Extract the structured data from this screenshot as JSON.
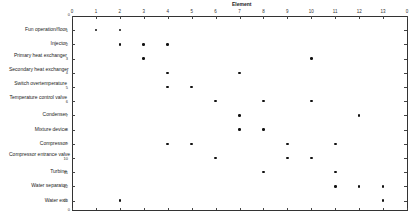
{
  "chart_data": {
    "type": "scatter",
    "title": "Element",
    "xlabel": "Element",
    "ylabel": "",
    "x_ticks": [
      "0",
      "1",
      "2",
      "3",
      "4",
      "5",
      "6",
      "7",
      "8",
      "9",
      "10",
      "11",
      "12",
      "13",
      "0"
    ],
    "xlim": [
      0,
      14
    ],
    "ylim": [
      0,
      14
    ],
    "y_top_label": "0",
    "y_bottom_label": "0",
    "grid": false,
    "legend": null,
    "rows": [
      {
        "index": 1,
        "label": "Fun operation/floor",
        "x": [
          1,
          2
        ]
      },
      {
        "index": 2,
        "label": "Injector",
        "x": [
          2,
          3,
          4
        ]
      },
      {
        "index": 3,
        "label": "Primary heat exchanger",
        "x": [
          3,
          10
        ]
      },
      {
        "index": 4,
        "label": "Secondary heat exchanger",
        "x": [
          4,
          7
        ]
      },
      {
        "index": 5,
        "label": "Switch overtemperature",
        "x": [
          4,
          5
        ]
      },
      {
        "index": 6,
        "label": "Temperature control valve",
        "x": [
          6,
          8,
          10
        ]
      },
      {
        "index": 7,
        "label": "Condenser",
        "x": [
          7,
          12
        ]
      },
      {
        "index": 8,
        "label": "Mixture device",
        "x": [
          7,
          8
        ]
      },
      {
        "index": 9,
        "label": "Compressor",
        "x": [
          4,
          5,
          9,
          11
        ]
      },
      {
        "index": 10,
        "label": "Compressor entrance valve",
        "x": [
          6,
          9,
          10
        ]
      },
      {
        "index": 11,
        "label": "Turbine",
        "x": [
          8,
          11
        ]
      },
      {
        "index": 12,
        "label": "Water separator",
        "x": [
          11,
          12,
          13
        ]
      },
      {
        "index": 13,
        "label": "Water exit",
        "x": [
          2,
          13
        ]
      }
    ]
  },
  "style": {
    "dot_color": "#111111",
    "axis_color": "#333333"
  }
}
